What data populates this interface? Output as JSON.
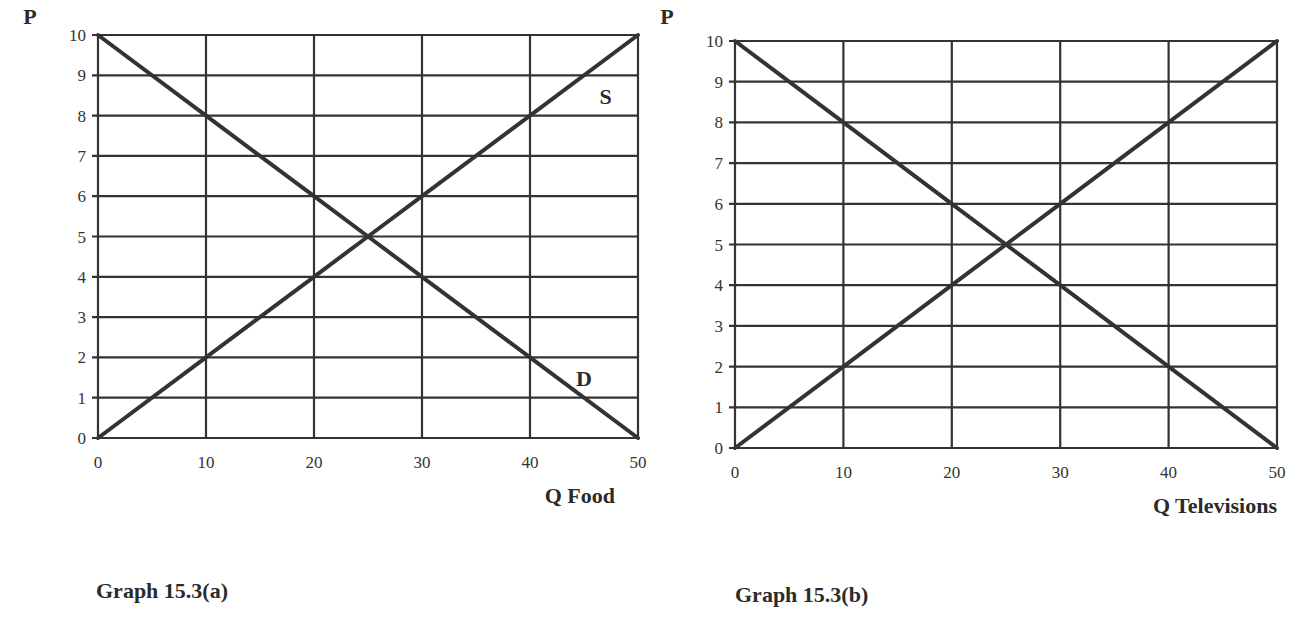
{
  "chart_data": [
    {
      "type": "line",
      "title": "Graph 15.3(a)",
      "xlabel": "Q Food",
      "ylabel": "P",
      "xlim": [
        0,
        50
      ],
      "ylim": [
        0,
        10
      ],
      "x_ticks": [
        "0",
        "10",
        "20",
        "30",
        "40",
        "50"
      ],
      "y_ticks": [
        "0",
        "1",
        "2",
        "3",
        "4",
        "5",
        "6",
        "7",
        "8",
        "9",
        "10"
      ],
      "grid": true,
      "series": [
        {
          "name": "D",
          "x": [
            0,
            10,
            20,
            25,
            30,
            40,
            50
          ],
          "y": [
            10,
            8,
            6,
            5,
            4,
            2,
            0
          ]
        },
        {
          "name": "S",
          "x": [
            0,
            10,
            20,
            25,
            30,
            40,
            50
          ],
          "y": [
            0,
            2,
            4,
            5,
            6,
            8,
            10
          ]
        }
      ],
      "annotations": [
        {
          "text": "S",
          "x": 47,
          "y": 8.3
        },
        {
          "text": "D",
          "x": 45,
          "y": 1.3
        }
      ]
    },
    {
      "type": "line",
      "title": "Graph 15.3(b)",
      "xlabel": "Q Televisions",
      "ylabel": "P",
      "xlim": [
        0,
        50
      ],
      "ylim": [
        0,
        10
      ],
      "x_ticks": [
        "0",
        "10",
        "20",
        "30",
        "40",
        "50"
      ],
      "y_ticks": [
        "0",
        "1",
        "2",
        "3",
        "4",
        "5",
        "6",
        "7",
        "8",
        "9",
        "10"
      ],
      "grid": true,
      "series": [
        {
          "name": "Demand",
          "x": [
            0,
            10,
            20,
            25,
            30,
            40,
            50
          ],
          "y": [
            10,
            8,
            6,
            5,
            4,
            2,
            0
          ]
        },
        {
          "name": "Supply",
          "x": [
            0,
            10,
            20,
            25,
            30,
            40,
            50
          ],
          "y": [
            0,
            2,
            4,
            5,
            6,
            8,
            10
          ]
        }
      ],
      "annotations": []
    }
  ],
  "graphs": {
    "a": {
      "ylabel": "P",
      "xlabel": "Q Food",
      "caption": "Graph 15.3(a)",
      "label_s": "S",
      "label_d": "D"
    },
    "b": {
      "ylabel": "P",
      "xlabel": "Q Televisions",
      "caption": "Graph 15.3(b)"
    }
  }
}
